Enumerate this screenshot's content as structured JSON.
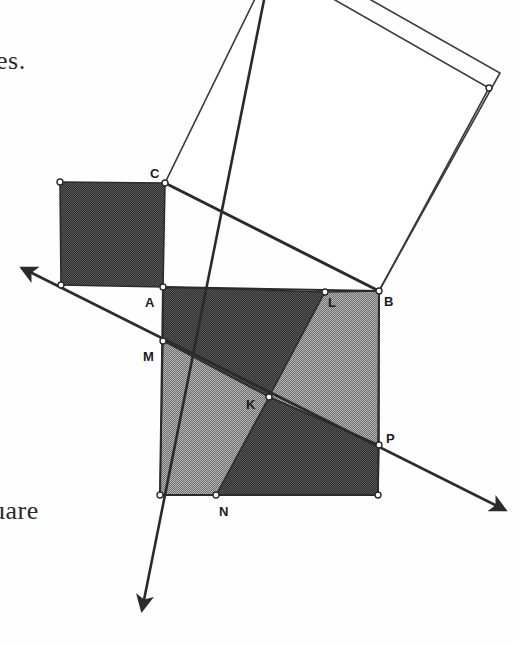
{
  "figure": {
    "caption_fragment_top": "es.",
    "caption_fragment_bottom": "uare",
    "colors": {
      "dark_fill": "#3c3c3c",
      "light_fill": "#8d8d8d",
      "white_fill": "#ffffff",
      "stroke": "#2b2b2b",
      "thin_stroke": "#3a3a3a",
      "vertex_fill": "#ffffff",
      "text": "#2a2a2a"
    },
    "labels": [
      {
        "name": "C",
        "text": "C",
        "x": 150,
        "y": 178
      },
      {
        "name": "A",
        "text": "A",
        "x": 145,
        "y": 307
      },
      {
        "name": "B",
        "text": "B",
        "x": 384,
        "y": 306
      },
      {
        "name": "L",
        "text": "L",
        "x": 328,
        "y": 307
      },
      {
        "name": "M",
        "text": "M",
        "x": 143,
        "y": 361
      },
      {
        "name": "K",
        "text": "K",
        "x": 246,
        "y": 409
      },
      {
        "name": "N",
        "text": "N",
        "x": 219,
        "y": 516
      },
      {
        "name": "P",
        "text": "P",
        "x": 386,
        "y": 443
      }
    ],
    "points": {
      "A": {
        "x": 163,
        "y": 287
      },
      "B": {
        "x": 379,
        "y": 291
      },
      "C": {
        "x": 165,
        "y": 183
      },
      "L": {
        "x": 325,
        "y": 292
      },
      "M": {
        "x": 163,
        "y": 341
      },
      "N": {
        "x": 216,
        "y": 495
      },
      "P": {
        "x": 379,
        "y": 445
      },
      "K": {
        "x": 269,
        "y": 397
      },
      "Dtl": {
        "x": 60,
        "y": 182
      },
      "Dbl": {
        "x": 61,
        "y": 285
      },
      "Qbl": {
        "x": 160,
        "y": 495
      },
      "Qbr": {
        "x": 378,
        "y": 495
      },
      "Hc": {
        "x": 272,
        "y": -36
      },
      "Hd": {
        "x": 489,
        "y": 88
      },
      "Pe": {
        "x": 318,
        "y": -30
      },
      "Pf": {
        "x": 500,
        "y": 73
      }
    },
    "shapes": {
      "small_square": {
        "name": "square-on-vertical-leg",
        "fill": "dark",
        "vertices": [
          [
            60,
            182
          ],
          [
            165,
            183
          ],
          [
            163,
            287
          ],
          [
            61,
            285
          ]
        ]
      },
      "big_square": {
        "name": "square-on-horizontal-leg",
        "vertices": [
          [
            163,
            287
          ],
          [
            379,
            291
          ],
          [
            378,
            495
          ],
          [
            160,
            495
          ]
        ]
      },
      "big_square_pieces": [
        {
          "name": "piece-top-dark",
          "fill": "dark",
          "vertices": [
            [
              163,
              287
            ],
            [
              325,
              292
            ],
            [
              269,
              397
            ],
            [
              163,
              341
            ]
          ]
        },
        {
          "name": "piece-right-light",
          "fill": "light",
          "vertices": [
            [
              325,
              292
            ],
            [
              379,
              291
            ],
            [
              379,
              445
            ],
            [
              269,
              397
            ]
          ]
        },
        {
          "name": "piece-bottom-dark",
          "fill": "dark",
          "vertices": [
            [
              269,
              397
            ],
            [
              379,
              445
            ],
            [
              378,
              495
            ],
            [
              216,
              495
            ]
          ]
        },
        {
          "name": "piece-left-light",
          "fill": "light",
          "vertices": [
            [
              163,
              341
            ],
            [
              269,
              397
            ],
            [
              216,
              495
            ],
            [
              160,
              495
            ]
          ]
        }
      ],
      "hypotenuse_square": {
        "name": "square-on-hypotenuse",
        "fill": "white",
        "vertices": [
          [
            165,
            183
          ],
          [
            379,
            291
          ],
          [
            489,
            88
          ],
          [
            272,
            -36
          ]
        ]
      },
      "hypotenuse_overlay": {
        "name": "translated-square-outline",
        "fill": "none",
        "vertices": [
          [
            379,
            291
          ],
          [
            500,
            73
          ],
          [
            318,
            -30
          ]
        ]
      }
    },
    "lines": [
      {
        "name": "hypotenuse-CB",
        "from": [
          165,
          183
        ],
        "to": [
          379,
          291
        ],
        "weight": "thick"
      },
      {
        "name": "ray-through-M-to-P",
        "from": [
          22,
          268
        ],
        "to": [
          505,
          510
        ],
        "weight": "thick",
        "arrow_start": true,
        "arrow_end": true,
        "waypoints": [
          [
            61,
            285
          ],
          [
            163,
            341
          ],
          [
            269,
            397
          ],
          [
            379,
            445
          ]
        ]
      },
      {
        "name": "ray-through-L-to-N",
        "from": [
          268,
          -20
        ],
        "to": [
          142,
          610
        ],
        "weight": "thick",
        "arrow_start": false,
        "arrow_end": true,
        "waypoints": [
          [
            325,
            292
          ],
          [
            269,
            397
          ],
          [
            216,
            495
          ]
        ]
      }
    ],
    "vertex_markers": [
      [
        60,
        182
      ],
      [
        165,
        183
      ],
      [
        163,
        287
      ],
      [
        61,
        285
      ],
      [
        379,
        291
      ],
      [
        325,
        292
      ],
      [
        163,
        341
      ],
      [
        269,
        397
      ],
      [
        379,
        445
      ],
      [
        378,
        495
      ],
      [
        216,
        495
      ],
      [
        160,
        495
      ],
      [
        489,
        88
      ]
    ]
  }
}
